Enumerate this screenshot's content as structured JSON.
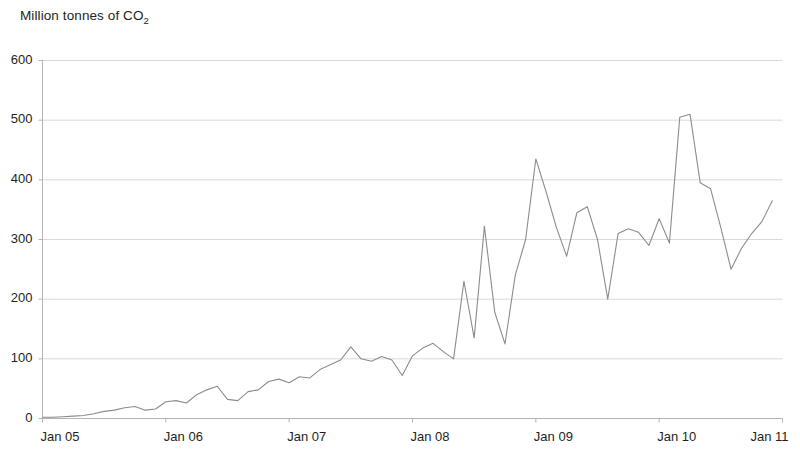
{
  "chart_data": {
    "type": "line",
    "title": "Million tonnes of CO2",
    "title_main": "Million tonnes of CO",
    "title_sub": "2",
    "xlabel": "",
    "ylabel": "",
    "ylim": [
      0,
      600
    ],
    "yticks": [
      0,
      100,
      200,
      300,
      400,
      500,
      600
    ],
    "ytick_labels": [
      "0",
      "100",
      "200",
      "300",
      "400",
      "500",
      "600"
    ],
    "xticks": [
      2005.0,
      2006.0,
      2007.0,
      2008.0,
      2009.0,
      2010.0,
      2011.0
    ],
    "xtick_labels": [
      "Jan 05",
      "Jan 06",
      "Jan 07",
      "Jan 08",
      "Jan 09",
      "Jan 10",
      "Jan 11"
    ],
    "xlim": [
      2005.0,
      2011.0
    ],
    "grid": "horizontal",
    "legend": "none",
    "line_color": "#8c8c8c",
    "grid_color": "#d9d9d9",
    "axis_color": "#b3b3b3",
    "series": [
      {
        "name": "Monthly CO2 volume",
        "x": [
          2005.0,
          2005.083,
          2005.167,
          2005.25,
          2005.333,
          2005.417,
          2005.5,
          2005.583,
          2005.667,
          2005.75,
          2005.833,
          2005.917,
          2006.0,
          2006.083,
          2006.167,
          2006.25,
          2006.333,
          2006.417,
          2006.5,
          2006.583,
          2006.667,
          2006.75,
          2006.833,
          2006.917,
          2007.0,
          2007.083,
          2007.167,
          2007.25,
          2007.333,
          2007.417,
          2007.5,
          2007.583,
          2007.667,
          2007.75,
          2007.833,
          2007.917,
          2008.0,
          2008.083,
          2008.167,
          2008.25,
          2008.333,
          2008.417,
          2008.5,
          2008.583,
          2008.667,
          2008.75,
          2008.833,
          2008.917,
          2009.0,
          2009.083,
          2009.167,
          2009.25,
          2009.333,
          2009.417,
          2009.5,
          2009.583,
          2009.667,
          2009.75,
          2009.833,
          2009.917,
          2010.0,
          2010.083,
          2010.167,
          2010.25,
          2010.333,
          2010.417,
          2010.5,
          2010.583,
          2010.667,
          2010.75,
          2010.833,
          2010.917
        ],
        "values": [
          2,
          2,
          3,
          4,
          5,
          8,
          12,
          14,
          18,
          20,
          14,
          16,
          28,
          30,
          26,
          40,
          48,
          54,
          32,
          30,
          45,
          48,
          62,
          66,
          60,
          70,
          68,
          82,
          90,
          98,
          120,
          100,
          96,
          104,
          98,
          72,
          105,
          118,
          126,
          112,
          100,
          230,
          135,
          322,
          178,
          125,
          240,
          300,
          435,
          380,
          320,
          272,
          345,
          355,
          300,
          200,
          310,
          318,
          312,
          290,
          335,
          294,
          505,
          510,
          395,
          385,
          320,
          250,
          285,
          310,
          330,
          365
        ]
      }
    ]
  }
}
